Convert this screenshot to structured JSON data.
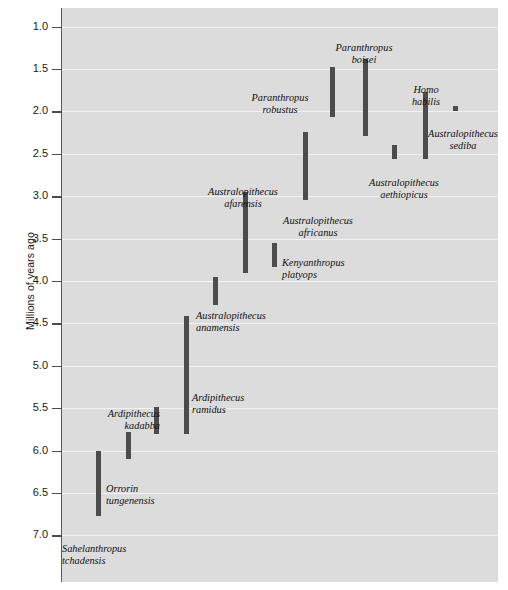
{
  "chart_data": {
    "type": "range_bar",
    "title": "",
    "xlabel": "",
    "ylabel": "Millions of years ago",
    "y_axis_inverted": true,
    "ylim": [
      0.78,
      7.55
    ],
    "grid": true,
    "legend": "none",
    "tick_labels": [
      "1.0",
      "1.5",
      "2.0",
      "2.5",
      "3.0",
      "3.5",
      "4.0",
      "4.5",
      "5.0",
      "5.5",
      "6.0",
      "6.5",
      "7.0"
    ],
    "tick_values": [
      1.0,
      1.5,
      2.0,
      2.5,
      3.0,
      3.5,
      4.0,
      4.5,
      5.0,
      5.5,
      6.0,
      6.5,
      7.0
    ],
    "bar_color": "#4c4c4c",
    "plot_background": "#dcdcdc",
    "gridline_color": "#f2f2f2",
    "series": [
      {
        "name": "Sahelanthropus tchadensis",
        "label_line1": "Sahelanthropus",
        "label_line2": "tchadensis",
        "start_mya": 6.77,
        "end_mya": 6.0,
        "x_px": 96,
        "label_x_px": 62,
        "label_y_px": 543,
        "label_align": "left"
      },
      {
        "name": "Orrorin tungenensis",
        "label_line1": "Orrorin",
        "label_line2": "tungenensis",
        "start_mya": 6.1,
        "end_mya": 5.78,
        "x_px": 126,
        "label_x_px": 106,
        "label_y_px": 483,
        "label_align": "left"
      },
      {
        "name": "Ardipithecus kadabba",
        "label_line1": "Ardipithecus",
        "label_line2": "kadabba",
        "start_mya": 5.8,
        "end_mya": 5.49,
        "x_px": 154,
        "label_x_px": 70,
        "label_y_px": 408,
        "label_align": "right",
        "label_width_px": 90
      },
      {
        "name": "Ardipithecus ramidus",
        "label_line1": "Ardipithecus",
        "label_line2": "ramidus",
        "start_mya": 5.8,
        "end_mya": 4.41,
        "x_px": 184,
        "label_x_px": 192,
        "label_y_px": 392,
        "label_align": "left"
      },
      {
        "name": "Australopithecus anamensis",
        "label_line1": "Australopithecus",
        "label_line2": "anamensis",
        "start_mya": 4.28,
        "end_mya": 3.95,
        "x_px": 213,
        "label_x_px": 196,
        "label_y_px": 310,
        "label_align": "left"
      },
      {
        "name": "Australopithecus afarensis",
        "label_line1": "Australopithecus",
        "label_line2": "afarensis",
        "start_mya": 3.91,
        "end_mya": 2.95,
        "x_px": 243,
        "label_x_px": 178,
        "label_y_px": 186,
        "label_align": "center",
        "label_width_px": 130
      },
      {
        "name": "Kenyanthropus platyops",
        "label_line1": "Kenyanthropus",
        "label_line2": "platyops",
        "start_mya": 3.83,
        "end_mya": 3.55,
        "x_px": 272,
        "label_x_px": 282,
        "label_y_px": 257,
        "label_align": "left"
      },
      {
        "name": "Australopithecus africanus",
        "label_line1": "Australopithecus",
        "label_line2": "africanus",
        "start_mya": 3.05,
        "end_mya": 2.24,
        "x_px": 303,
        "label_x_px": 272,
        "label_y_px": 215,
        "label_align": "center",
        "label_width_px": 92
      },
      {
        "name": "Paranthropus robustus",
        "label_line1": "Paranthropus",
        "label_line2": "robustus",
        "start_mya": 2.06,
        "end_mya": 1.47,
        "x_px": 330,
        "label_x_px": 232,
        "label_y_px": 92,
        "label_align": "center",
        "label_width_px": 96
      },
      {
        "name": "Paranthropus boisei",
        "label_line1": "Paranthropus",
        "label_line2": "boisei",
        "start_mya": 2.29,
        "end_mya": 1.38,
        "x_px": 363,
        "label_x_px": 324,
        "label_y_px": 42,
        "label_align": "center",
        "label_width_px": 80
      },
      {
        "name": "Australopithecus aethiopicus",
        "label_line1": "Australopithecus",
        "label_line2": "aethiopicus",
        "start_mya": 2.56,
        "end_mya": 2.4,
        "x_px": 392,
        "label_x_px": 352,
        "label_y_px": 177,
        "label_align": "center",
        "label_width_px": 104
      },
      {
        "name": "Homo habilis",
        "label_line1": "Homo",
        "label_line2": "habilis",
        "start_mya": 2.56,
        "end_mya": 1.77,
        "x_px": 423,
        "label_x_px": 398,
        "label_y_px": 84,
        "label_align": "center",
        "label_width_px": 56
      },
      {
        "name": "Australopithecus sediba",
        "label_line1": "Australopithecus",
        "label_line2": "sediba",
        "start_mya": 1.99,
        "end_mya": 1.94,
        "x_px": 453,
        "label_x_px": 418,
        "label_y_px": 128,
        "label_align": "center",
        "label_width_px": 90
      }
    ]
  }
}
